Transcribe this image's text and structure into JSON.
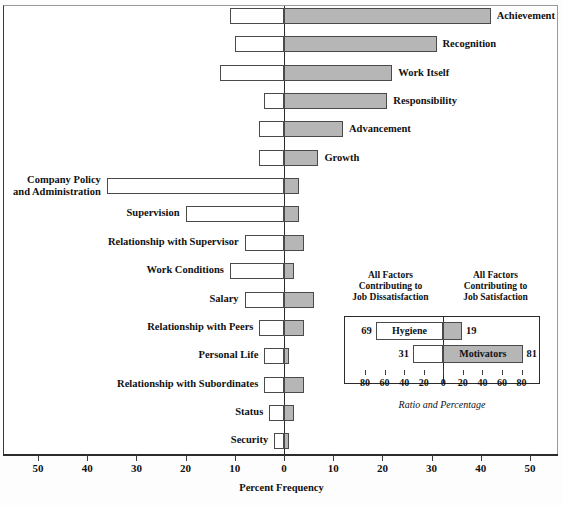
{
  "chart_data": {
    "type": "bar",
    "title": "",
    "xlabel": "Percent Frequency",
    "ylabel": "",
    "orientation": "horizontal",
    "xlim": [
      -55,
      55
    ],
    "grid": false,
    "legend_position": "inset-bottom-right",
    "axis_ticks": [
      50,
      40,
      30,
      20,
      10,
      0,
      10,
      20,
      30,
      40,
      50
    ],
    "series": [
      {
        "name": "Dissatisfaction (left, white)",
        "color": "#ffffff"
      },
      {
        "name": "Satisfaction (right, gray)",
        "color": "#b6b6b6"
      }
    ],
    "categories": [
      "Achievement",
      "Recognition",
      "Work Itself",
      "Responsibility",
      "Advancement",
      "Growth",
      "Company Policy and Administration",
      "Supervision",
      "Relationship with Supervisor",
      "Work Conditions",
      "Salary",
      "Relationship with Peers",
      "Personal Life",
      "Relationship with Subordinates",
      "Status",
      "Security"
    ],
    "rows": [
      {
        "label": "Achievement",
        "label_side": "right",
        "neg": 11,
        "pos": 42
      },
      {
        "label": "Recognition",
        "label_side": "right",
        "neg": 10,
        "pos": 31
      },
      {
        "label": "Work Itself",
        "label_side": "right",
        "neg": 13,
        "pos": 22
      },
      {
        "label": "Responsibility",
        "label_side": "right",
        "neg": 4,
        "pos": 21
      },
      {
        "label": "Advancement",
        "label_side": "right",
        "neg": 5,
        "pos": 12
      },
      {
        "label": "Growth",
        "label_side": "right",
        "neg": 5,
        "pos": 7
      },
      {
        "label": "Company Policy\nand Administration",
        "label_side": "left",
        "neg": 36,
        "pos": 3
      },
      {
        "label": "Supervision",
        "label_side": "left",
        "neg": 20,
        "pos": 3
      },
      {
        "label": "Relationship with Supervisor",
        "label_side": "left",
        "neg": 8,
        "pos": 4
      },
      {
        "label": "Work Conditions",
        "label_side": "left",
        "neg": 11,
        "pos": 2
      },
      {
        "label": "Salary",
        "label_side": "left",
        "neg": 8,
        "pos": 6
      },
      {
        "label": "Relationship with Peers",
        "label_side": "left",
        "neg": 5,
        "pos": 4
      },
      {
        "label": "Personal Life",
        "label_side": "left",
        "neg": 4,
        "pos": 1
      },
      {
        "label": "Relationship with Subordinates",
        "label_side": "left",
        "neg": 4,
        "pos": 4
      },
      {
        "label": "Status",
        "label_side": "left",
        "neg": 3,
        "pos": 2
      },
      {
        "label": "Security",
        "label_side": "left",
        "neg": 2,
        "pos": 1
      }
    ],
    "inset": {
      "heading_left": "All Factors\nContributing to\nJob Dissatisfaction",
      "heading_right": "All Factors\nContributing to\nJob Satisfaction",
      "caption": "Ratio and Percentage",
      "ticks": [
        80,
        60,
        40,
        20,
        0,
        20,
        40,
        60,
        80
      ],
      "xlim": [
        -100,
        100
      ],
      "bars": [
        {
          "label": "Hygiene",
          "neg": 69,
          "pos": 19,
          "neg_label": "69",
          "pos_label": "19",
          "label_in": "left"
        },
        {
          "label": "Motivators",
          "neg": 31,
          "pos": 81,
          "neg_label": "31",
          "pos_label": "81",
          "label_in": "right"
        }
      ]
    }
  },
  "colors": {
    "bar_fill_satisfaction": "#b6b6b6",
    "bar_fill_dissatisfaction": "#ffffff",
    "bar_stroke": "#4a4a4a",
    "axis": "#2b2b2b",
    "text": "#111111",
    "background": "#ffffff"
  }
}
